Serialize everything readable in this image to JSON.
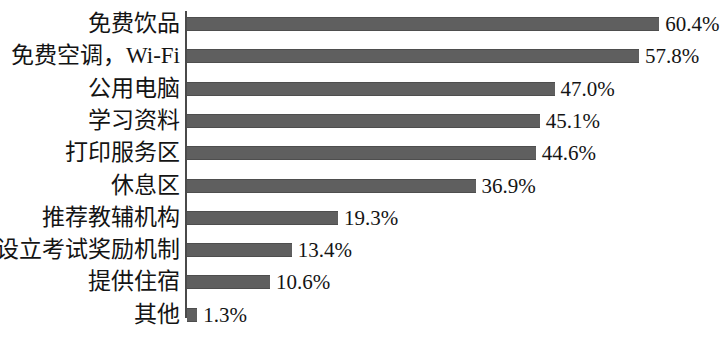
{
  "chart_data": {
    "type": "bar",
    "orientation": "horizontal",
    "title": "",
    "subtitle": "",
    "xlabel": "",
    "ylabel": "",
    "grid": false,
    "legend": false,
    "legend_position": "none",
    "xlim": [
      0,
      63
    ],
    "value_suffix": "%",
    "categories": [
      "免费饮品",
      "免费空调，Wi-Fi",
      "公用电脑",
      "学习资料",
      "打印服务区",
      "休息区",
      "推荐教辅机构",
      "设立考试奖励机制",
      "提供住宿",
      "其他"
    ],
    "values": [
      60.4,
      57.8,
      47.0,
      45.1,
      44.6,
      36.9,
      19.3,
      13.4,
      10.6,
      1.3
    ],
    "value_labels": [
      "60.4%",
      "57.8%",
      "47.0%",
      "45.1%",
      "44.6%",
      "36.9%",
      "19.3%",
      "13.4%",
      "10.6%",
      "1.3%"
    ],
    "bar_color": "#5f5f5f",
    "axis_color": "#4a4a4a",
    "background_color": "#ffffff",
    "text_color": "#141414"
  }
}
